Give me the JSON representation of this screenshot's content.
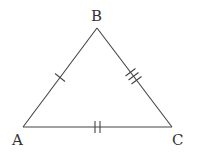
{
  "diagram": {
    "type": "triangle",
    "stroke_color": "#444444",
    "vertices": [
      {
        "name": "A",
        "x": 23,
        "y": 127,
        "label_x": 12,
        "label_y": 145
      },
      {
        "name": "B",
        "x": 97,
        "y": 28,
        "label_x": 91,
        "label_y": 20
      },
      {
        "name": "C",
        "x": 172,
        "y": 127,
        "label_x": 172,
        "label_y": 145
      }
    ],
    "sides": [
      {
        "name": "AB",
        "tick_marks": 1
      },
      {
        "name": "BC",
        "tick_marks": 3
      },
      {
        "name": "AC",
        "tick_marks": 2
      }
    ]
  }
}
